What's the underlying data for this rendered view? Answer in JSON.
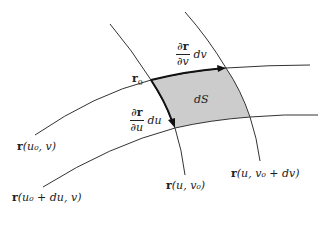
{
  "diagram": {
    "colors": {
      "curve": "#333333",
      "patch_fill": "#cccccc",
      "arrow": "#111111",
      "background": "#ffffff"
    },
    "labels": {
      "r0_bold": "r",
      "r0_sub": "0",
      "dS": "dS",
      "dv_vector": {
        "num_partial": "∂",
        "num_bold": "r",
        "den": "∂v",
        "tail": "dv"
      },
      "du_vector": {
        "num_partial": "∂",
        "num_bold": "r",
        "den": "∂u",
        "tail": "du"
      },
      "curve_u0_v": {
        "bold": "r",
        "rest": "(u₀, v)"
      },
      "curve_u0du_v": {
        "bold": "r",
        "rest": "(u₀ + du, v)"
      },
      "curve_u_v0": {
        "bold": "r",
        "rest": "(u, v₀)"
      },
      "curve_u_v0dv": {
        "bold": "r",
        "rest": "(u, v₀ + dv)"
      }
    }
  }
}
